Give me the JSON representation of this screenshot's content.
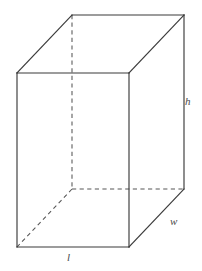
{
  "figure": {
    "name": "rectangular-prism-dimensions",
    "background_color": "#ffffff",
    "solid_edge_color": "#3a3a3a",
    "hidden_edge_color": "#565656",
    "label_color": "#4a4a4a"
  },
  "labels": {
    "height": "h",
    "width": "w",
    "length": "l"
  },
  "geometry": {
    "front_face": {
      "top_left": [
        17,
        73
      ],
      "top_right": [
        129,
        73
      ],
      "bottom_right": [
        129,
        247
      ],
      "bottom_left": [
        17,
        247
      ]
    },
    "back_face": {
      "top_left": [
        72,
        15
      ],
      "top_right": [
        184,
        15
      ],
      "bottom_right": [
        184,
        189
      ],
      "bottom_left": [
        72,
        189
      ]
    },
    "visible_edges": [
      [
        [
          17,
          73
        ],
        [
          129,
          73
        ]
      ],
      [
        [
          129,
          73
        ],
        [
          129,
          247
        ]
      ],
      [
        [
          129,
          247
        ],
        [
          17,
          247
        ]
      ],
      [
        [
          17,
          247
        ],
        [
          17,
          73
        ]
      ],
      [
        [
          17,
          73
        ],
        [
          72,
          15
        ]
      ],
      [
        [
          72,
          15
        ],
        [
          184,
          15
        ]
      ],
      [
        [
          184,
          15
        ],
        [
          184,
          189
        ]
      ],
      [
        [
          129,
          73
        ],
        [
          184,
          15
        ]
      ],
      [
        [
          129,
          247
        ],
        [
          184,
          189
        ]
      ]
    ],
    "hidden_edges": [
      [
        [
          72,
          15
        ],
        [
          72,
          189
        ]
      ],
      [
        [
          72,
          189
        ],
        [
          184,
          189
        ]
      ],
      [
        [
          72,
          189
        ],
        [
          17,
          247
        ]
      ]
    ]
  }
}
